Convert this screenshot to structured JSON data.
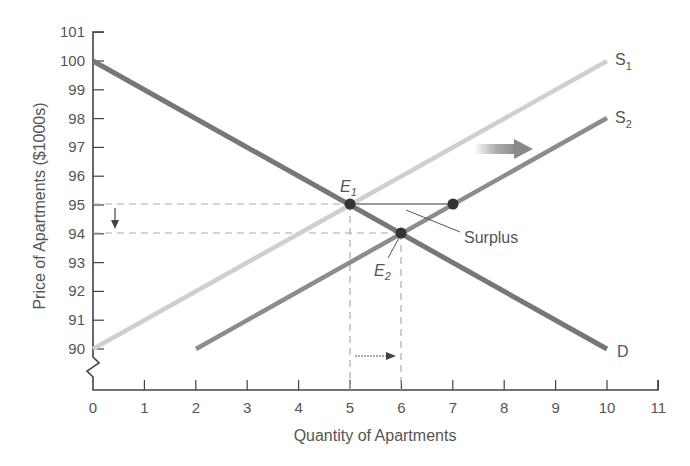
{
  "chart_data": {
    "type": "line",
    "title": "",
    "xlabel": "Quantity of Apartments",
    "ylabel": "Price of Apartments ($1000s)",
    "xlim": [
      0,
      11
    ],
    "ylim": [
      90,
      101
    ],
    "y_axis_break": true,
    "grid": false,
    "x_ticks": [
      "0",
      "1",
      "2",
      "3",
      "4",
      "5",
      "6",
      "7",
      "8",
      "9",
      "10",
      "11"
    ],
    "y_ticks": [
      "90",
      "91",
      "92",
      "93",
      "94",
      "95",
      "96",
      "97",
      "98",
      "99",
      "100",
      "101"
    ],
    "series": [
      {
        "name": "S1",
        "label_main": "S",
        "label_sub": "1",
        "color": "#c8c8c8",
        "points": [
          [
            0,
            90
          ],
          [
            10,
            100
          ]
        ]
      },
      {
        "name": "S2",
        "label_main": "S",
        "label_sub": "2",
        "color": "#8a8a8a",
        "points": [
          [
            2,
            90
          ],
          [
            10,
            98
          ]
        ]
      },
      {
        "name": "D",
        "label_main": "D",
        "label_sub": "",
        "color": "#7a7a7a",
        "points": [
          [
            0,
            100
          ],
          [
            10,
            90
          ]
        ]
      }
    ],
    "points": [
      {
        "name": "E1",
        "label_main": "E",
        "label_sub": "1",
        "x": 5,
        "y": 95
      },
      {
        "name": "E2",
        "label_main": "E",
        "label_sub": "2",
        "x": 6,
        "y": 94
      },
      {
        "name": "surplus-end",
        "x": 7,
        "y": 95
      }
    ],
    "annotations": [
      {
        "text": "Surplus",
        "from": [
          5,
          95
        ],
        "to": [
          7,
          95
        ]
      },
      {
        "text": "",
        "type": "shift-arrow",
        "description": "supply shifts right"
      },
      {
        "text": "",
        "type": "price-down-arrow",
        "from": 95,
        "to": 94
      },
      {
        "text": "",
        "type": "quantity-right-arrow",
        "from": 5,
        "to": 6
      }
    ],
    "reference_lines": [
      {
        "type": "h-dashed",
        "y": 95,
        "x_to": 5
      },
      {
        "type": "h-dashed",
        "y": 94,
        "x_to": 6
      },
      {
        "type": "v-dashed",
        "x": 5,
        "y_from": 95
      },
      {
        "type": "v-dashed",
        "x": 6,
        "y_from": 94
      }
    ]
  },
  "labels": {
    "xlabel": "Quantity of Apartments",
    "ylabel": "Price of Apartments ($1000s)",
    "surplus": "Surplus",
    "s1_main": "S",
    "s1_sub": "1",
    "s2_main": "S",
    "s2_sub": "2",
    "d": "D",
    "e1_main": "E",
    "e1_sub": "1",
    "e2_main": "E",
    "e2_sub": "2"
  }
}
